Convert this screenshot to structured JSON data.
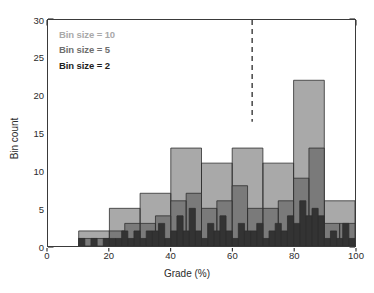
{
  "figure": {
    "background": "#ffffff",
    "frame_color": "#3a3a3a"
  },
  "legend": {
    "position": "top-left-inside",
    "entries": [
      {
        "label": "Bin size = 10",
        "color": "#a9a9a9"
      },
      {
        "label": "Bin size = 5",
        "color": "#7a7a7a"
      },
      {
        "label": "Bin size = 2",
        "color": "#333333"
      }
    ]
  },
  "axes": {
    "x": {
      "title": "Grade (%)",
      "min": 0,
      "max": 100,
      "major_ticks": [
        0,
        20,
        40,
        60,
        80,
        100
      ],
      "tick_labels": [
        "0",
        "20",
        "40",
        "60",
        "80",
        "100"
      ],
      "minor_tick_step": 5
    },
    "y": {
      "title": "Bin count",
      "min": 0,
      "max": 30,
      "major_ticks": [
        0,
        5,
        10,
        15,
        20,
        25,
        30
      ],
      "tick_labels": [
        "0",
        "5",
        "10",
        "15",
        "20",
        "25",
        "30"
      ],
      "minor_tick_step": 1
    }
  },
  "annotations": {
    "threshold_line": {
      "name": "dashed-threshold-line",
      "x_value": 66.5,
      "style": "dashed",
      "color": "#3a3a3a",
      "y_top": 30,
      "y_bottom": 16.5
    }
  },
  "chart_data": {
    "type": "bar",
    "title": "",
    "xlabel": "Grade (%)",
    "ylabel": "Bin count",
    "xlim": [
      0,
      100
    ],
    "ylim": [
      0,
      30
    ],
    "grid": false,
    "legend_position": "upper left",
    "overlay": "layered histograms of the same grade distribution at three bin widths",
    "series": [
      {
        "name": "Bin size = 10",
        "color": "#a9a9a9",
        "bin_width": 10,
        "bin_edges": [
          0,
          10,
          20,
          30,
          40,
          50,
          60,
          70,
          80,
          90,
          100
        ],
        "values": [
          0,
          2,
          5,
          7,
          13,
          11,
          13,
          11,
          22,
          6
        ]
      },
      {
        "name": "Bin size = 5",
        "color": "#7a7a7a",
        "bin_width": 5,
        "bin_edges": [
          0,
          5,
          10,
          15,
          20,
          25,
          30,
          35,
          40,
          45,
          50,
          55,
          60,
          65,
          70,
          75,
          80,
          85,
          90,
          95,
          100
        ],
        "values": [
          0,
          0,
          1,
          1,
          2,
          3,
          3,
          4,
          6,
          7,
          5,
          6,
          8,
          5,
          5,
          6,
          9,
          13,
          3,
          3
        ]
      },
      {
        "name": "Bin size = 2",
        "color": "#333333",
        "bin_width": 2,
        "bin_edges": [
          0,
          2,
          4,
          6,
          8,
          10,
          12,
          14,
          16,
          18,
          20,
          22,
          24,
          26,
          28,
          30,
          32,
          34,
          36,
          38,
          40,
          42,
          44,
          46,
          48,
          50,
          52,
          54,
          56,
          58,
          60,
          62,
          64,
          66,
          68,
          70,
          72,
          74,
          76,
          78,
          80,
          82,
          84,
          86,
          88,
          90,
          92,
          94,
          96,
          98,
          100
        ],
        "values": [
          0,
          0,
          0,
          0,
          0,
          1,
          0,
          1,
          0,
          1,
          1,
          1,
          2,
          1,
          2,
          1,
          2,
          2,
          3,
          1,
          2,
          4,
          2,
          5,
          2,
          1,
          3,
          2,
          4,
          2,
          1,
          3,
          2,
          2,
          3,
          1,
          2,
          3,
          2,
          4,
          3,
          6,
          4,
          5,
          4,
          1,
          2,
          1,
          3,
          1
        ]
      }
    ]
  }
}
